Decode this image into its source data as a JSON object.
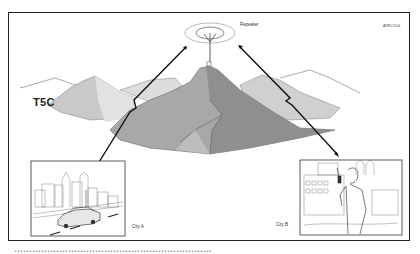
{
  "figure": {
    "repeater_label": "Repeater",
    "figure_code": "ARRL2104",
    "side_label": "T5C",
    "city_a_label": "City A",
    "city_b_label": "City B",
    "caption_cut": "…………………………………………………………"
  },
  "colors": {
    "frame": "#222222",
    "mountain_far": "#d8d8d8",
    "mountain_light": "#c4c4c4",
    "mountain_mid": "#a9a9a9",
    "mountain_dark": "#8e8e8e",
    "signal": "#111111"
  }
}
